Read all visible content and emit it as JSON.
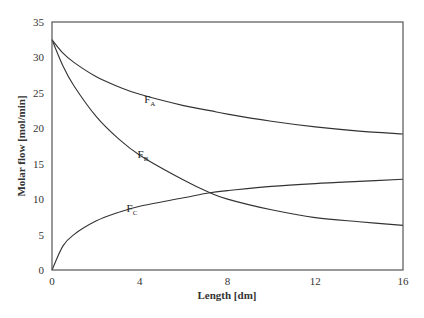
{
  "chart_data": {
    "type": "line",
    "title": "",
    "xlabel": "Length [dm]",
    "ylabel": "Molar flow [mol/min]",
    "xlim": [
      0,
      16
    ],
    "ylim": [
      0,
      35
    ],
    "x_ticks": [
      0,
      4,
      8,
      12,
      16
    ],
    "y_ticks": [
      0,
      5,
      10,
      15,
      20,
      25,
      30,
      35
    ],
    "grid": false,
    "legend": "inline labels",
    "x": [
      0,
      0.5,
      1,
      2,
      3,
      4,
      6,
      7.2,
      8,
      10,
      12,
      14,
      16
    ],
    "series": [
      {
        "name": "FA",
        "label_main": "F",
        "label_sub": "A",
        "label_at": [
          4.2,
          23.5
        ],
        "values": [
          32.5,
          30.6,
          29.3,
          27.3,
          25.9,
          24.8,
          23.2,
          22.5,
          22.0,
          21.0,
          20.2,
          19.6,
          19.2
        ]
      },
      {
        "name": "FB",
        "label_main": "F",
        "label_sub": "B",
        "label_at": [
          3.9,
          15.8
        ],
        "values": [
          32.5,
          28.8,
          26.0,
          21.7,
          18.6,
          16.2,
          12.7,
          10.9,
          10.0,
          8.5,
          7.4,
          6.8,
          6.3
        ]
      },
      {
        "name": "FC",
        "label_main": "F",
        "label_sub": "C",
        "label_at": [
          3.4,
          8.2
        ],
        "values": [
          0,
          3.4,
          5.0,
          6.9,
          8.1,
          9.0,
          10.2,
          10.9,
          11.2,
          11.8,
          12.2,
          12.5,
          12.8
        ]
      }
    ]
  }
}
